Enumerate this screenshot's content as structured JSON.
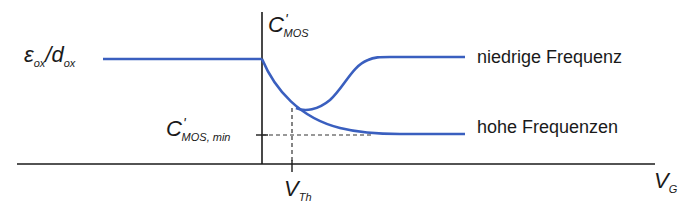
{
  "diagram": {
    "colors": {
      "curve": "#3a5fbf",
      "axis": "#1a1a1a",
      "dashed": "#333333",
      "text": "#1a1a1a"
    },
    "y_axis": {
      "main": "C",
      "prime": "'",
      "subscript": "MOS"
    },
    "x_axis": {
      "main": "V",
      "subscript": "G"
    },
    "ox_label": {
      "epsilon": "ε",
      "eps_sub": "ox",
      "slash": "/",
      "d": "d",
      "d_sub": "ox"
    },
    "cmin_label": {
      "main": "C",
      "prime": "'",
      "subscript": "MOS, min"
    },
    "vth_label": {
      "main": "V",
      "subscript": "Th"
    },
    "legend": {
      "low": "niedrige Frequenz",
      "high": "hohe Frequenzen"
    }
  }
}
